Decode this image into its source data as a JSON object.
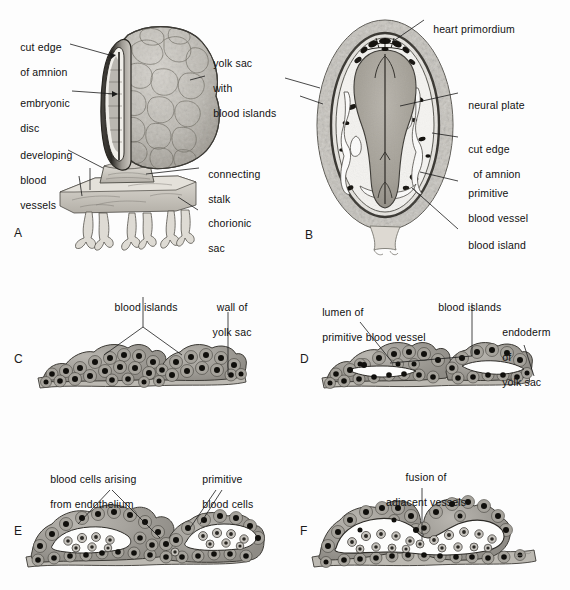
{
  "figure": {
    "background": "#fdfdfd",
    "ink": "#1a1a1a"
  },
  "panels": [
    {
      "id": "A",
      "letter": "A",
      "caption": "Embryo with yolk sac, connecting stalk and chorionic sac",
      "labels": [
        {
          "name": "cut-edge-of-amnion",
          "lines": [
            "cut edge",
            "of amnion"
          ]
        },
        {
          "name": "embryonic-disc",
          "lines": [
            "embryonic",
            "disc"
          ]
        },
        {
          "name": "developing-blood-vessels",
          "lines": [
            "developing",
            "blood",
            "vessels"
          ]
        },
        {
          "name": "yolk-sac-with-blood-islands",
          "lines": [
            "yolk sac",
            "with",
            "blood islands"
          ]
        },
        {
          "name": "connecting-stalk",
          "lines": [
            "connecting",
            "stalk"
          ]
        },
        {
          "name": "chorionic-sac",
          "lines": [
            "chorionic",
            "sac"
          ]
        }
      ]
    },
    {
      "id": "B",
      "letter": "B",
      "caption": "Dorsal view of embryonic disc showing neural plate and blood islands",
      "labels": [
        {
          "name": "heart-primordium",
          "lines": [
            "heart primordium"
          ]
        },
        {
          "name": "neural-plate",
          "lines": [
            "neural plate"
          ]
        },
        {
          "name": "cut-edge-of-amnion",
          "lines": [
            "cut edge",
            "of amnion"
          ]
        },
        {
          "name": "primitive-blood-vessel",
          "lines": [
            "primitive",
            "blood vessel"
          ]
        },
        {
          "name": "blood-island",
          "lines": [
            "blood island"
          ]
        }
      ]
    },
    {
      "id": "C",
      "letter": "C",
      "caption": "Blood islands on wall of yolk sac",
      "labels": [
        {
          "name": "blood-islands",
          "lines": [
            "blood islands"
          ]
        },
        {
          "name": "wall-of-yolk-sac",
          "lines": [
            "wall of",
            "yolk sac"
          ]
        }
      ]
    },
    {
      "id": "D",
      "letter": "D",
      "caption": "Cavitation of blood islands forming primitive vessel lumina",
      "labels": [
        {
          "name": "lumen-of-primitive-blood-vessel",
          "lines": [
            "lumen of",
            "primitive blood vessel"
          ]
        },
        {
          "name": "blood-islands",
          "lines": [
            "blood islands"
          ]
        },
        {
          "name": "endoderm-of-yolk-sac",
          "lines": [
            "endoderm",
            "of",
            "yolk sac"
          ]
        }
      ]
    },
    {
      "id": "E",
      "letter": "E",
      "caption": "Primitive blood cells arising from endothelium",
      "labels": [
        {
          "name": "blood-cells-arising-from-endothelium",
          "lines": [
            "blood cells arising",
            "from endothelium"
          ]
        },
        {
          "name": "primitive-blood-cells",
          "lines": [
            "primitive",
            "blood cells"
          ]
        }
      ]
    },
    {
      "id": "F",
      "letter": "F",
      "caption": "Fusion of adjacent vessels into a continuous lumen",
      "labels": [
        {
          "name": "fusion-of-adjacent-vessels",
          "lines": [
            "fusion of",
            "adjacent vessels"
          ]
        }
      ]
    }
  ],
  "labels": {
    "a_cut_edge_1": "cut edge",
    "a_cut_edge_2": "of amnion",
    "a_embryonic_1": "embryonic",
    "a_embryonic_2": "disc",
    "a_developing_1": "developing",
    "a_developing_2": "blood",
    "a_developing_3": "vessels",
    "a_yolk_1": "yolk sac",
    "a_yolk_2": "with",
    "a_yolk_3": "blood islands",
    "a_stalk_1": "connecting",
    "a_stalk_2": "stalk",
    "a_chorionic_1": "chorionic",
    "a_chorionic_2": "sac",
    "a_letter": "A",
    "b_heart": "heart primordium",
    "b_neural": "neural plate",
    "b_cut_1": "cut edge",
    "b_cut_2": "of amnion",
    "b_prim_1": "primitive",
    "b_prim_2": "blood vessel",
    "b_island": "blood island",
    "b_letter": "B",
    "c_islands": "blood islands",
    "c_wall_1": "wall of",
    "c_wall_2": "yolk sac",
    "c_letter": "C",
    "d_lumen_1": "lumen of",
    "d_lumen_2": "primitive blood vessel",
    "d_islands": "blood islands",
    "d_endo_1": "endoderm",
    "d_endo_2": "of",
    "d_endo_3": "yolk sac",
    "d_letter": "D",
    "e_cells_1": "blood cells arising",
    "e_cells_2": "from endothelium",
    "e_prim_1": "primitive",
    "e_prim_2": "blood cells",
    "e_letter": "E",
    "f_fusion_1": "fusion of",
    "f_fusion_2": "adjacent vessels",
    "f_letter": "F"
  }
}
